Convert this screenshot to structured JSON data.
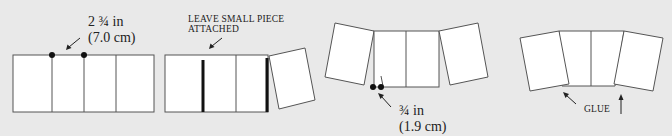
{
  "diagram": {
    "steps": [
      {
        "id": "step-1",
        "description": "Strip of four equal panels with measurement marks",
        "annotation": {
          "line1": "2 ¾ in",
          "line2": "(7.0 cm)"
        }
      },
      {
        "id": "step-2",
        "description": "Cut along fold lines, last panel rotated",
        "annotation": {
          "line1": "LEAVE SMALL PIECE",
          "line2": "ATTACHED"
        }
      },
      {
        "id": "step-3",
        "description": "Outer panels rotated outward, overlap marked",
        "annotation": {
          "line1": "¾ in",
          "line2": "(1.9 cm)"
        }
      },
      {
        "id": "step-4",
        "description": "Outer panels glued to form curved shape",
        "annotation": {
          "line1": "GLUE"
        }
      }
    ],
    "colors": {
      "background": "#e9e9e9",
      "panel_fill": "#ffffff",
      "outline": "#555555",
      "cut_line": "#111111"
    }
  }
}
